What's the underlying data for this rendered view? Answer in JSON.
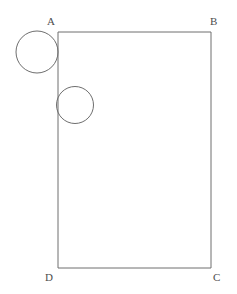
{
  "figure": {
    "canvas": {
      "width": 237,
      "height": 294,
      "background": "#ffffff"
    },
    "style": {
      "stroke_color": "#6e6e6e",
      "stroke_width": 1,
      "label_color": "#4d4d4d",
      "label_font_size": 11,
      "fill": "none"
    },
    "rectangle": {
      "name": "ABCD",
      "x": 58,
      "y": 32,
      "width": 153,
      "height": 236,
      "vertices": [
        {
          "id": "A",
          "label": "A",
          "x": 58,
          "y": 32,
          "label_x": 47,
          "label_y": 25
        },
        {
          "id": "B",
          "label": "B",
          "x": 211,
          "y": 32,
          "label_x": 210,
          "label_y": 25
        },
        {
          "id": "C",
          "label": "C",
          "x": 211,
          "y": 268,
          "label_x": 213,
          "label_y": 281
        },
        {
          "id": "D",
          "label": "D",
          "x": 58,
          "y": 268,
          "label_x": 45,
          "label_y": 281
        }
      ]
    },
    "circles": [
      {
        "id": "circle-large",
        "cx": 37,
        "cy": 52,
        "r": 21
      },
      {
        "id": "circle-small",
        "cx": 75,
        "cy": 105,
        "r": 18.5
      }
    ]
  }
}
